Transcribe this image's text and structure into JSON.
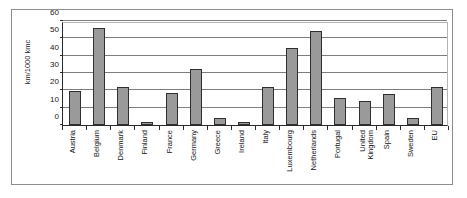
{
  "chart_data": {
    "type": "bar",
    "title": "",
    "subtitle": "",
    "xlabel": "",
    "ylabel": "km/1000 kmc",
    "ylim": [
      0,
      60
    ],
    "ytick_step": 10,
    "yticks": [
      0,
      10,
      20,
      30,
      40,
      50,
      60
    ],
    "ytick_labels": [
      "0",
      "10",
      "20",
      "30",
      "40",
      "50",
      "60"
    ],
    "grid": true,
    "grid_axis": "y",
    "legend": false,
    "legend_position": "none",
    "bar_color": "#9a9a9a",
    "bar_edge_color": "#2f2f2f",
    "axis_color": "#2b2b2b",
    "gridline_color": "#7d7d7d",
    "background_color": "#ffffff",
    "categories": [
      "Austria",
      "Belgium",
      "Denmark",
      "Finland",
      "France",
      "Germany",
      "Greece",
      "Ireland",
      "Italy",
      "Luxembourg",
      "Netherlands",
      "Portugal",
      "United Kingdom",
      "Spain",
      "Sweden",
      "EU"
    ],
    "values": [
      19.5,
      56,
      21.7,
      1.8,
      18.3,
      32.3,
      4,
      2,
      21.8,
      44.2,
      54,
      15.5,
      14,
      18,
      4,
      21.8
    ],
    "series": [
      {
        "name": "",
        "values": [
          19.5,
          56,
          21.7,
          1.8,
          18.3,
          32.3,
          4,
          2,
          21.8,
          44.2,
          54,
          15.5,
          14,
          18,
          4,
          21.8
        ]
      }
    ]
  }
}
